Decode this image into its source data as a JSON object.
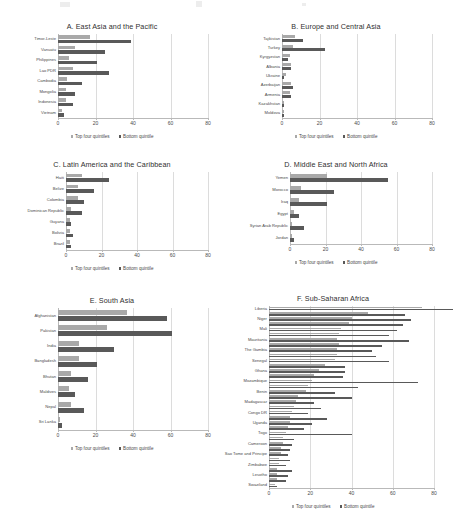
{
  "legend": {
    "top4_label": "Top four quintiles",
    "bottom_label": "Bottom quintile",
    "top4_color": "#a9a9a9",
    "bottom_color": "#595959"
  },
  "axis": {
    "ticks": [
      "0",
      "20",
      "40",
      "60",
      "80"
    ],
    "min": 0,
    "max": 80
  },
  "chart_data": [
    {
      "type": "bar",
      "title": "A. East Asia and the Pacific",
      "orientation": "horizontal",
      "grouped": true,
      "xlabel": "",
      "ylabel": "",
      "xlim": [
        0,
        80
      ],
      "xticks": [
        0,
        20,
        40,
        60,
        80
      ],
      "grid": true,
      "legend_position": "bottom",
      "categories": [
        "Timor-Leste",
        "Vanuatu",
        "Philippines",
        "Lao PDR",
        "Cambodia",
        "Mongolia",
        "Indonesia",
        "Vietnam"
      ],
      "series": [
        {
          "name": "Top four quintiles",
          "values": [
            17,
            9,
            6,
            8,
            5,
            4,
            4,
            2
          ]
        },
        {
          "name": "Bottom quintile",
          "values": [
            39,
            25,
            21,
            27,
            13,
            9,
            8,
            3
          ]
        }
      ]
    },
    {
      "type": "bar",
      "title": "B. Europe and Central Asia",
      "orientation": "horizontal",
      "grouped": true,
      "xlabel": "",
      "ylabel": "",
      "xlim": [
        0,
        80
      ],
      "xticks": [
        0,
        20,
        40,
        60,
        80
      ],
      "grid": true,
      "legend_position": "bottom",
      "categories": [
        "Tajikistan",
        "Turkey",
        "Kyrgyzstan",
        "Albania",
        "Ukraine",
        "Azerbaijan",
        "Armenia",
        "Kazakhstan",
        "Moldova"
      ],
      "series": [
        {
          "name": "Top four quintiles",
          "values": [
            7,
            6,
            4,
            5,
            2,
            5,
            4,
            1,
            1
          ]
        },
        {
          "name": "Bottom quintile",
          "values": [
            11,
            23,
            3,
            5,
            1,
            6,
            5,
            1,
            1
          ]
        }
      ]
    },
    {
      "type": "bar",
      "title": "C. Latin America and the Caribbean",
      "orientation": "horizontal",
      "grouped": true,
      "xlabel": "",
      "ylabel": "",
      "xlim": [
        0,
        80
      ],
      "xticks": [
        0,
        20,
        40,
        60,
        80
      ],
      "grid": true,
      "legend_position": "bottom",
      "categories": [
        "Haiti",
        "Belize",
        "Colombia",
        "Dominican Republic",
        "Guyana",
        "Bolivia",
        "Brazil"
      ],
      "series": [
        {
          "name": "Top four quintiles",
          "values": [
            9,
            7,
            7,
            3,
            2,
            2,
            2
          ]
        },
        {
          "name": "Bottom quintile",
          "values": [
            24,
            16,
            10,
            9,
            3,
            4,
            3
          ]
        }
      ]
    },
    {
      "type": "bar",
      "title": "D. Middle East and North Africa",
      "orientation": "horizontal",
      "grouped": true,
      "xlabel": "",
      "ylabel": "",
      "xlim": [
        0,
        80
      ],
      "xticks": [
        0,
        20,
        40,
        60,
        80
      ],
      "grid": true,
      "legend_position": "bottom",
      "categories": [
        "Yemen",
        "Morocco",
        "Iraq",
        "Egypt",
        "Syrian Arab Republic",
        "Jordan"
      ],
      "series": [
        {
          "name": "Top four quintiles",
          "values": [
            21,
            6,
            5,
            2,
            1,
            1
          ]
        },
        {
          "name": "Bottom quintile",
          "values": [
            55,
            25,
            21,
            5,
            8,
            2
          ]
        }
      ]
    },
    {
      "type": "bar",
      "title": "E. South Asia",
      "orientation": "horizontal",
      "grouped": true,
      "xlabel": "",
      "ylabel": "",
      "xlim": [
        0,
        80
      ],
      "xticks": [
        0,
        20,
        40,
        60,
        80
      ],
      "grid": true,
      "legend_position": "bottom",
      "categories": [
        "Afghanistan",
        "Pakistan",
        "India",
        "Bangladesh",
        "Bhutan",
        "Maldives",
        "Nepal",
        "Sri Lanka"
      ],
      "series": [
        {
          "name": "Top four quintiles",
          "values": [
            37,
            26,
            11,
            11,
            7,
            6,
            7,
            1
          ]
        },
        {
          "name": "Bottom quintile",
          "values": [
            58,
            61,
            30,
            21,
            16,
            9,
            14,
            2
          ]
        }
      ]
    },
    {
      "type": "bar",
      "title": "F. Sub-Saharan Africa",
      "orientation": "horizontal",
      "grouped": true,
      "xlabel": "",
      "ylabel": "",
      "xlim": [
        0,
        80
      ],
      "xticks": [
        0,
        20,
        40,
        60,
        80
      ],
      "grid": true,
      "legend_position": "bottom",
      "label_every_other": true,
      "categories": [
        "Liberia",
        "Guinea",
        "Niger",
        "Burkina Faso",
        "Mali",
        "Chad",
        "Mauritania",
        "Sierra Leone",
        "The Gambia",
        "Nigeria",
        "Senegal",
        "Cote d'Ivoire",
        "Ghana",
        "Ethiopia",
        "Mozambique",
        "Rwanda",
        "Benin",
        "Malawi",
        "Madagascar",
        "Tanzania",
        "Congo DR",
        "Zambia",
        "Uganda",
        "Kenya",
        "Togo",
        "Burundi",
        "Cameroon",
        "Namibia",
        "Sao Tome and Principe",
        "Comoros",
        "Zimbabwe",
        "Gabon",
        "Lesotho",
        "Botswana",
        "Swaziland"
      ],
      "series": [
        {
          "name": "Top four quintiles",
          "values": [
            74,
            48,
            40,
            39,
            35,
            34,
            33,
            34,
            33,
            33,
            32,
            27,
            24,
            22,
            21,
            19,
            18,
            14,
            13,
            12,
            11,
            10,
            10,
            9,
            8,
            7,
            7,
            6,
            6,
            5,
            5,
            4,
            4,
            4,
            3
          ]
        },
        {
          "name": "Bottom quintile",
          "values": [
            89,
            66,
            69,
            65,
            62,
            58,
            68,
            55,
            50,
            52,
            58,
            37,
            37,
            36,
            72,
            43,
            32,
            40,
            22,
            25,
            19,
            28,
            21,
            17,
            40,
            12,
            11,
            10,
            9,
            10,
            8,
            11,
            9,
            8,
            4
          ]
        }
      ]
    }
  ]
}
